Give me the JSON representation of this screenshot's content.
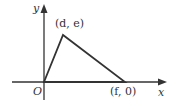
{
  "diagram": {
    "type": "coordinate-triangle",
    "axes": {
      "x_label": "x",
      "y_label": "y",
      "origin_label": "O"
    },
    "vertices": [
      {
        "name": "origin",
        "label": "O"
      },
      {
        "name": "apex",
        "label": "(d, e)"
      },
      {
        "name": "x-intercept",
        "label": "(f, 0)"
      }
    ],
    "colors": {
      "stroke": "#333333",
      "background": "#ffffff"
    }
  }
}
